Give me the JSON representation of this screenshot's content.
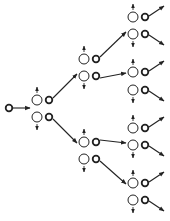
{
  "diagram": {
    "type": "branching-tree",
    "colors": {
      "stroke": "#222222",
      "background": "#ffffff"
    },
    "source": {
      "x": 9,
      "y": 108
    },
    "levels": [
      {
        "level": 1,
        "pairs": [
          {
            "x": 37,
            "top_y": 100,
            "bottom_y": 117
          }
        ]
      },
      {
        "level": 2,
        "pairs": [
          {
            "x": 84,
            "top_y": 59,
            "bottom_y": 76
          },
          {
            "x": 84,
            "top_y": 142,
            "bottom_y": 159
          }
        ]
      },
      {
        "level": 3,
        "pairs": [
          {
            "x": 133,
            "top_y": 17,
            "bottom_y": 34
          },
          {
            "x": 133,
            "top_y": 72,
            "bottom_y": 90
          },
          {
            "x": 133,
            "top_y": 128,
            "bottom_y": 145
          },
          {
            "x": 133,
            "top_y": 183,
            "bottom_y": 200
          }
        ]
      }
    ]
  }
}
